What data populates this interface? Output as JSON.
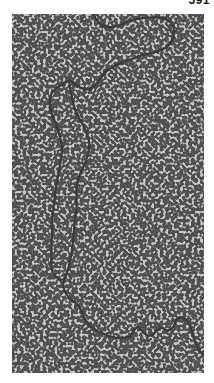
{
  "page_label": "591",
  "figure": {
    "background_color": "#c8c8c8",
    "strand_color": "#3a3a3a"
  }
}
